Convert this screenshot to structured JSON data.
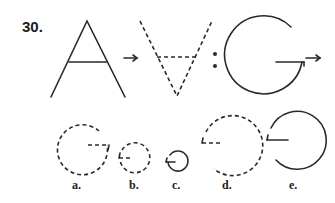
{
  "question": {
    "number": "30.",
    "analogy": {
      "first_term": "A",
      "relation_arrow": "→",
      "second_term": "inverted dashed A (V with dashed crossbar)",
      "separator": ":",
      "third_term": "G",
      "fourth_term_arrow": "→"
    }
  },
  "options": [
    {
      "label": "a.",
      "description": "large dashed G"
    },
    {
      "label": "b.",
      "description": "small dashed mirrored G"
    },
    {
      "label": "c.",
      "description": "small solid mirrored G"
    },
    {
      "label": "d.",
      "description": "large dashed mirrored G"
    },
    {
      "label": "e.",
      "description": "large solid mirrored G"
    }
  ],
  "colors": {
    "ink": "#2a2a2a",
    "background": "#ffffff"
  }
}
